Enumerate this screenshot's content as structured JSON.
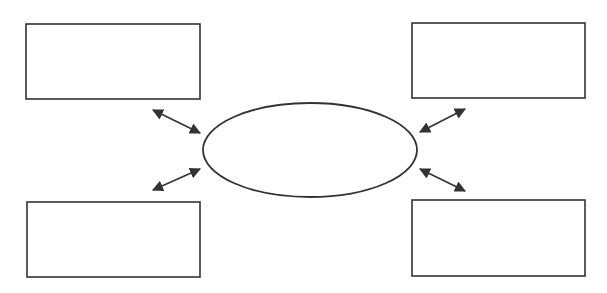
{
  "diagram": {
    "type": "mind-map",
    "stroke_color": "#333333",
    "background": "#ffffff",
    "center": {
      "shape": "ellipse",
      "label": "",
      "cx": 310,
      "cy": 150,
      "rx": 107,
      "ry": 47
    },
    "boxes": [
      {
        "id": "top-left",
        "label": "",
        "x": 26,
        "y": 24,
        "w": 174,
        "h": 75
      },
      {
        "id": "top-right",
        "label": "",
        "x": 412,
        "y": 23,
        "w": 173,
        "h": 75
      },
      {
        "id": "bottom-left",
        "label": "",
        "x": 27,
        "y": 202,
        "w": 173,
        "h": 75
      },
      {
        "id": "bottom-right",
        "label": "",
        "x": 412,
        "y": 200,
        "w": 173,
        "h": 76
      }
    ],
    "arrows": [
      {
        "id": "top-left",
        "x1": 153,
        "y1": 110,
        "x2": 200,
        "y2": 133,
        "bidirectional": true
      },
      {
        "id": "bottom-left",
        "x1": 153,
        "y1": 190,
        "x2": 200,
        "y2": 169,
        "bidirectional": true
      },
      {
        "id": "top-right",
        "x1": 420,
        "y1": 132,
        "x2": 465,
        "y2": 109,
        "bidirectional": true
      },
      {
        "id": "bottom-right",
        "x1": 420,
        "y1": 169,
        "x2": 465,
        "y2": 191,
        "bidirectional": true
      }
    ]
  }
}
